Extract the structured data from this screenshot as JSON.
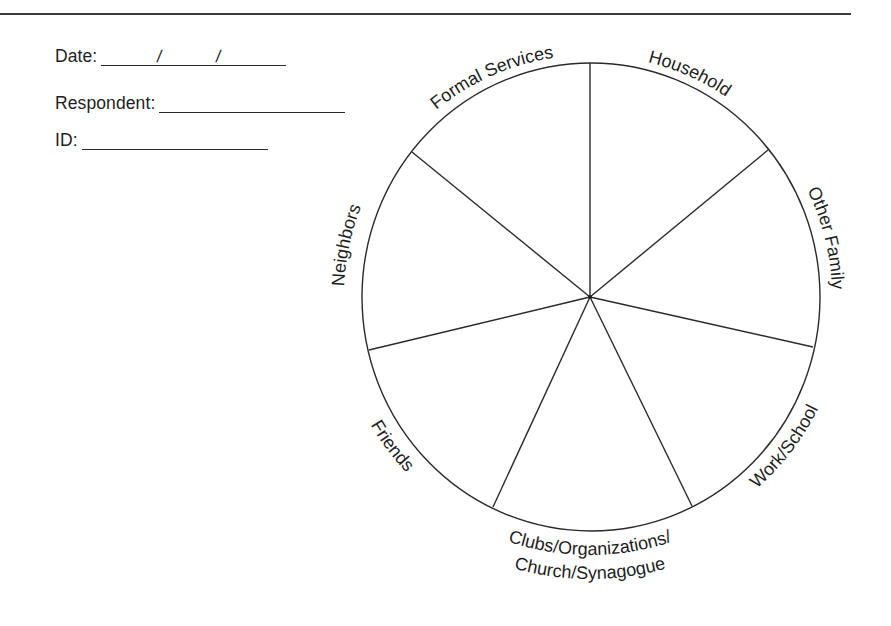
{
  "form": {
    "date": {
      "label": "Date:",
      "separator": "/"
    },
    "respondent": {
      "label": "Respondent:"
    },
    "id": {
      "label": "ID:"
    }
  },
  "wheel": {
    "sectors": [
      {
        "id": "formal-services",
        "label": "Formal Services"
      },
      {
        "id": "household",
        "label": "Household"
      },
      {
        "id": "other-family",
        "label": "Other Family"
      },
      {
        "id": "work-school",
        "label": "Work/School"
      },
      {
        "id": "clubs",
        "label": "Clubs/Organizations/",
        "label_line2": "Church/Synagogue"
      },
      {
        "id": "friends",
        "label": "Friends"
      },
      {
        "id": "neighbors",
        "label": "Neighbors"
      }
    ],
    "line_color": "#2a2a2a"
  }
}
